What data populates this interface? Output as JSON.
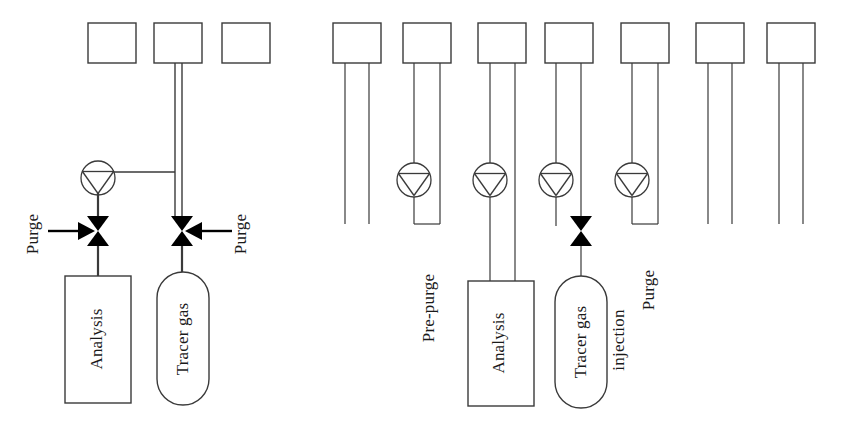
{
  "figure": {
    "orientation": "page rotated 90 degrees counter-clockwise",
    "background_color": "#ffffff",
    "line_color": "#3a3a3a",
    "fill_color": "#000000",
    "text_color": "#1a1a1a"
  },
  "labels": {
    "purge_left": "Purge",
    "purge_right": "Purge",
    "analysis_left": "Analysis",
    "tracer_gas_left": "Tracer gas",
    "pre_purge": "Pre-purge",
    "analysis_right": "Analysis",
    "tracer_gas_right": "Tracer gas",
    "injection": "injection",
    "purge_far_right": "Purge"
  },
  "left_diagram": {
    "name": "single-point sampling schematic",
    "top_boxes": [
      {
        "id": "box-1",
        "label": ""
      },
      {
        "id": "box-2",
        "label": ""
      },
      {
        "id": "box-3",
        "label": ""
      }
    ],
    "components": [
      {
        "id": "pump-1",
        "type": "pump-icon",
        "label": ""
      },
      {
        "id": "valve-analysis",
        "type": "valve-icon",
        "label": ""
      },
      {
        "id": "valve-tracer",
        "type": "valve-icon",
        "label": ""
      },
      {
        "id": "vessel-analysis",
        "type": "rectangle-vessel",
        "label": "Analysis"
      },
      {
        "id": "vessel-tracer",
        "type": "cylinder-vessel",
        "label": "Tracer gas"
      }
    ],
    "purge_arrows": [
      {
        "id": "purge-arrow-left",
        "label": "Purge",
        "direction": "right"
      },
      {
        "id": "purge-arrow-right",
        "label": "Purge",
        "direction": "left"
      }
    ]
  },
  "right_diagram": {
    "name": "multi-point sampling manifold schematic",
    "column_count": 7,
    "columns": [
      {
        "id": "column-1",
        "box_label": "",
        "component": "none",
        "label": ""
      },
      {
        "id": "column-2",
        "box_label": "",
        "component": "pump-loop",
        "label": "Pre-purge"
      },
      {
        "id": "column-3",
        "box_label": "",
        "component": "pump-to-analysis",
        "label": "Analysis"
      },
      {
        "id": "column-4",
        "box_label": "",
        "component": "pump-valve-tracer",
        "label": "Tracer gas",
        "label2": "injection"
      },
      {
        "id": "column-5",
        "box_label": "",
        "component": "pump-loop",
        "label": "Purge"
      },
      {
        "id": "column-6",
        "box_label": "",
        "component": "none",
        "label": ""
      },
      {
        "id": "column-7",
        "box_label": "",
        "component": "none",
        "label": ""
      }
    ]
  }
}
